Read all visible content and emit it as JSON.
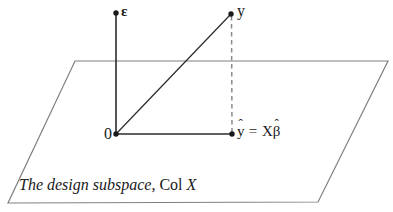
{
  "figure": {
    "background_color": "#ffffff",
    "width": 393,
    "height": 212,
    "colors": {
      "plane_stroke": "#808080",
      "vector_stroke": "#2b2b2b",
      "dashed_stroke": "#8a8a8a",
      "text": "#1a1a1a"
    },
    "labels": {
      "epsilon": "ε",
      "y": "y",
      "origin": "0",
      "yhat_y": "y",
      "yhat_hat": "ˆ",
      "yhat_equals": " = ",
      "yhat_bigx": "X",
      "yhat_beta": "β",
      "yhat_beta_hat": "ˆ",
      "yhat_full": "ŷ = Xβ̂",
      "caption_italic": "The design subspace,",
      "caption_roman": "Col",
      "caption_var": "X"
    },
    "geometry": {
      "plane_points": "75,61 388,61 318,202 8,203",
      "epsilon_axis": {
        "x1": 116,
        "y1": 13,
        "x2": 116,
        "y2": 134
      },
      "projection_segment": {
        "x1": 116,
        "y1": 134,
        "x2": 232,
        "y2": 134
      },
      "y_vector": {
        "x1": 116,
        "y1": 134,
        "x2": 231,
        "y2": 14
      },
      "residual_dashed": {
        "x1": 231,
        "y1": 15,
        "x2": 232,
        "y2": 133
      },
      "dots": [
        {
          "name": "epsilon-tip",
          "cx": 116,
          "cy": 13,
          "r": 2.6
        },
        {
          "name": "y-point",
          "cx": 231,
          "cy": 14,
          "r": 2.6
        },
        {
          "name": "origin-point",
          "cx": 116,
          "cy": 134,
          "r": 2.6
        },
        {
          "name": "yhat-point",
          "cx": 232,
          "cy": 134,
          "r": 2.6
        }
      ]
    }
  }
}
